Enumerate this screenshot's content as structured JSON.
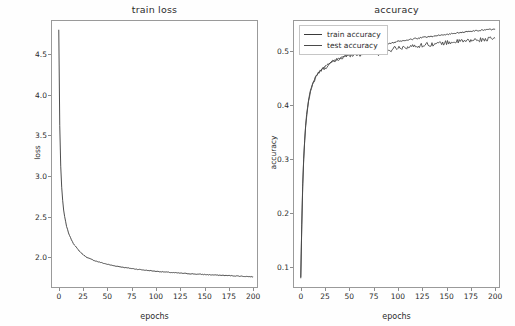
{
  "figure": {
    "background_color": "#fefefe",
    "line_color": "#3a3a3a",
    "axis_color": "#9a9a9a"
  },
  "chart_data": [
    {
      "type": "line",
      "name": "train-loss",
      "title": "train loss",
      "xlabel": "epochs",
      "ylabel": "loss",
      "grid": false,
      "legend": null,
      "xlim": [
        -8,
        205
      ],
      "ylim": [
        1.62,
        4.92
      ],
      "xticks": [
        0,
        25,
        50,
        75,
        100,
        125,
        150,
        175,
        200
      ],
      "xtick_labels": [
        "0",
        "25",
        "50",
        "75",
        "100",
        "125",
        "150",
        "175",
        "200"
      ],
      "yticks": [
        2.0,
        2.5,
        3.0,
        3.5,
        4.0,
        4.5
      ],
      "ytick_labels": [
        "2.0",
        "2.5",
        "3.0",
        "3.5",
        "4.0",
        "4.5"
      ],
      "series": [
        {
          "name": "train loss",
          "color": "#3a3a3a",
          "x": [
            0,
            1,
            2,
            3,
            4,
            5,
            6,
            8,
            10,
            12,
            15,
            18,
            20,
            25,
            30,
            35,
            40,
            45,
            50,
            55,
            60,
            65,
            70,
            75,
            80,
            85,
            90,
            95,
            100,
            110,
            120,
            130,
            140,
            150,
            160,
            170,
            180,
            190,
            200
          ],
          "values": [
            4.8,
            3.62,
            3.12,
            2.86,
            2.7,
            2.58,
            2.5,
            2.38,
            2.3,
            2.24,
            2.17,
            2.12,
            2.09,
            2.03,
            1.99,
            1.965,
            1.945,
            1.928,
            1.912,
            1.898,
            1.888,
            1.878,
            1.868,
            1.86,
            1.852,
            1.845,
            1.838,
            1.832,
            1.826,
            1.816,
            1.807,
            1.799,
            1.792,
            1.786,
            1.78,
            1.775,
            1.77,
            1.764,
            1.758
          ]
        }
      ]
    },
    {
      "type": "line",
      "name": "accuracy",
      "title": "accuracy",
      "xlabel": "epochs",
      "ylabel": "accuracy",
      "grid": false,
      "legend": {
        "position": "upper-left",
        "entries": [
          "train accuracy",
          "test accuracy"
        ]
      },
      "xlim": [
        -8,
        205
      ],
      "ylim": [
        0.062,
        0.558
      ],
      "xticks": [
        0,
        25,
        50,
        75,
        100,
        125,
        150,
        175,
        200
      ],
      "xtick_labels": [
        "0",
        "25",
        "50",
        "75",
        "100",
        "125",
        "150",
        "175",
        "200"
      ],
      "yticks": [
        0.1,
        0.2,
        0.3,
        0.4,
        0.5
      ],
      "ytick_labels": [
        "0.1",
        "0.2",
        "0.3",
        "0.4",
        "0.5"
      ],
      "series": [
        {
          "name": "train accuracy",
          "color": "#3a3a3a",
          "x": [
            0,
            1,
            2,
            3,
            4,
            5,
            6,
            8,
            10,
            12,
            15,
            18,
            20,
            25,
            30,
            35,
            40,
            45,
            50,
            55,
            60,
            65,
            70,
            75,
            80,
            85,
            90,
            95,
            100,
            110,
            120,
            130,
            140,
            150,
            160,
            170,
            180,
            190,
            200
          ],
          "values": [
            0.08,
            0.175,
            0.25,
            0.3,
            0.335,
            0.362,
            0.383,
            0.41,
            0.428,
            0.44,
            0.452,
            0.46,
            0.464,
            0.472,
            0.478,
            0.483,
            0.487,
            0.49,
            0.494,
            0.497,
            0.5,
            0.503,
            0.505,
            0.508,
            0.51,
            0.512,
            0.514,
            0.516,
            0.518,
            0.521,
            0.524,
            0.527,
            0.529,
            0.531,
            0.534,
            0.536,
            0.538,
            0.54,
            0.541
          ]
        },
        {
          "name": "test accuracy",
          "color": "#4a4a4a",
          "x": [
            0,
            1,
            2,
            3,
            4,
            5,
            6,
            8,
            10,
            12,
            15,
            18,
            20,
            25,
            30,
            35,
            40,
            45,
            50,
            55,
            60,
            65,
            70,
            75,
            80,
            85,
            90,
            95,
            100,
            110,
            120,
            130,
            140,
            150,
            160,
            170,
            180,
            190,
            200
          ],
          "values": [
            0.082,
            0.18,
            0.255,
            0.302,
            0.333,
            0.36,
            0.38,
            0.408,
            0.426,
            0.438,
            0.45,
            0.459,
            0.463,
            0.47,
            0.477,
            0.482,
            0.486,
            0.49,
            0.493,
            0.496,
            0.493,
            0.498,
            0.5,
            0.502,
            0.495,
            0.504,
            0.498,
            0.506,
            0.507,
            0.508,
            0.51,
            0.513,
            0.514,
            0.516,
            0.518,
            0.519,
            0.521,
            0.522,
            0.524
          ]
        }
      ]
    }
  ]
}
